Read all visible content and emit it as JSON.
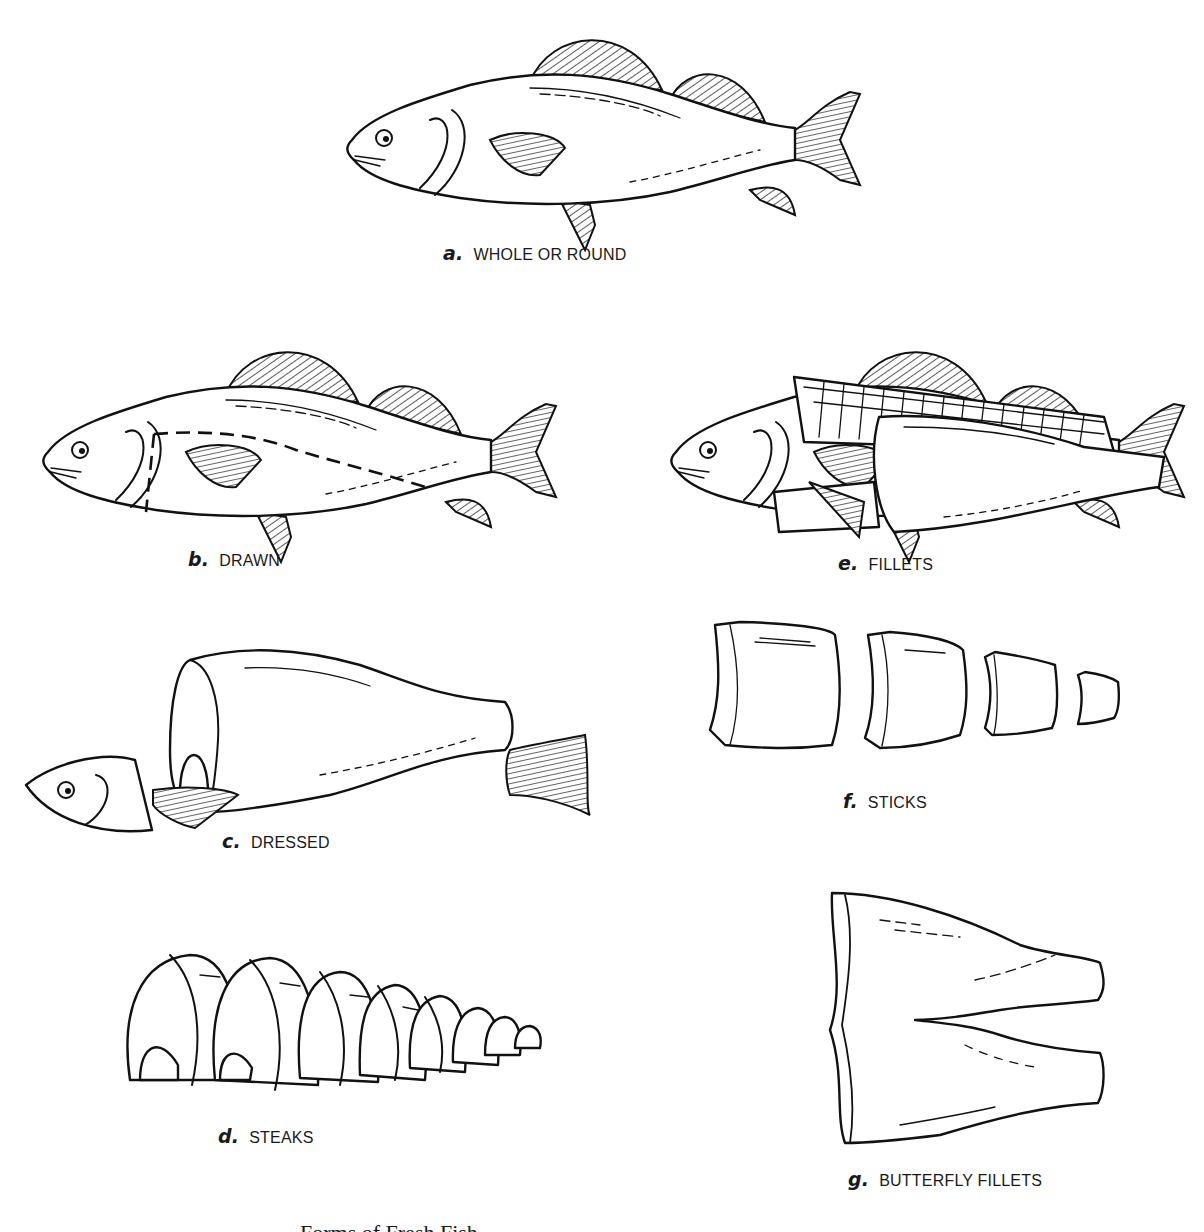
{
  "figure": {
    "panels": [
      {
        "id": "a",
        "letter": "a.",
        "label": "WHOLE OR ROUND"
      },
      {
        "id": "b",
        "letter": "b.",
        "label": "DRAWN"
      },
      {
        "id": "c",
        "letter": "c.",
        "label": "DRESSED"
      },
      {
        "id": "d",
        "letter": "d.",
        "label": "STEAKS"
      },
      {
        "id": "e",
        "letter": "e.",
        "label": "FILLETS"
      },
      {
        "id": "f",
        "letter": "f.",
        "label": "STICKS"
      },
      {
        "id": "g",
        "letter": "g.",
        "label": "BUTTERFLY FILLETS"
      }
    ],
    "caption": "Forms of Fresh Fish"
  },
  "colors": {
    "ink": "#111111",
    "paper": "#ffffff"
  }
}
